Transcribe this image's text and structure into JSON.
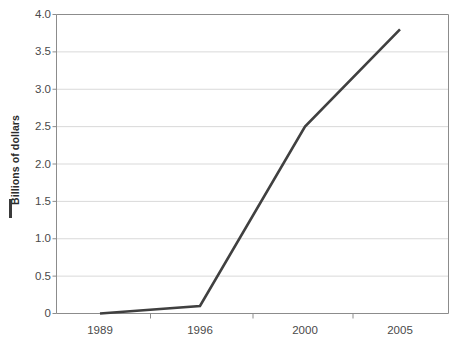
{
  "chart_data": {
    "type": "line",
    "title": "",
    "subtitle": "",
    "xlabel": "",
    "ylabel": "Billions of dollars",
    "categories": [
      "1989",
      "1996",
      "2000",
      "2005"
    ],
    "values": [
      0.0,
      0.1,
      2.5,
      3.8
    ],
    "series": [
      {
        "name": "Billions of dollars",
        "values": [
          0.0,
          0.1,
          2.5,
          3.8
        ],
        "color": "#404040"
      }
    ],
    "ylim": [
      0,
      4.0
    ],
    "ytick_values": [
      0,
      0.5,
      1.0,
      1.5,
      2.0,
      2.5,
      3.0,
      3.5,
      4.0
    ],
    "ytick_labels": [
      "0",
      "0.5",
      "1.0",
      "1.5",
      "2.0",
      "2.5",
      "3.0",
      "3.5",
      "4.0"
    ],
    "xtick_labels": [
      "1989",
      "1996",
      "2000",
      "2005"
    ],
    "xtick_positions": [
      100,
      200,
      305,
      400
    ],
    "grid": true,
    "grid_axis": "y",
    "legend": "none",
    "legend_marker": "line-dash",
    "colors": {
      "line": "#404040",
      "grid": "#d9d9d9",
      "frame": "#8c8c8c",
      "tick_text": "#4a4a4a",
      "axis_label_text": "#2b2b2b",
      "background": "#ffffff"
    }
  }
}
